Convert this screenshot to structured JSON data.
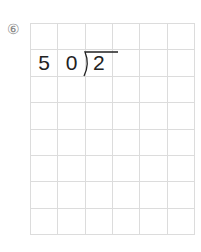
{
  "problem": {
    "number": "⑥",
    "divisor_digits": [
      "5",
      "0"
    ],
    "dividend_digits": [
      "2"
    ]
  },
  "grid": {
    "columns": 6,
    "rows": 8
  }
}
